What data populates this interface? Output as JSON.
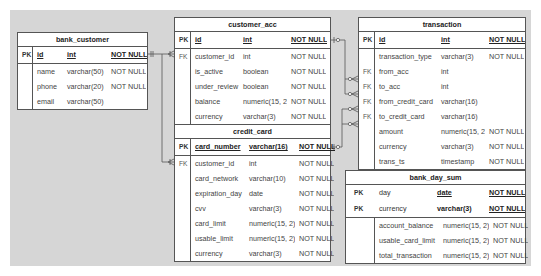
{
  "diagram": {
    "background": "#d6d6d6",
    "tables": {
      "bank_customer": {
        "title": "bank_customer",
        "pk": [
          {
            "key": "PK",
            "name": "id",
            "type": "int",
            "null": "NOT NULL"
          }
        ],
        "columns": [
          {
            "key": "",
            "name": "name",
            "type": "varchar(50)",
            "null": "NOT NULL"
          },
          {
            "key": "",
            "name": "phone",
            "type": "varchar(20)",
            "null": "NOT NULL"
          },
          {
            "key": "",
            "name": "email",
            "type": "varchar(50)",
            "null": ""
          }
        ]
      },
      "customer_acc": {
        "title": "customer_acc",
        "pk": [
          {
            "key": "PK",
            "name": "id",
            "type": "int",
            "null": "NOT NULL"
          }
        ],
        "columns": [
          {
            "key": "FK",
            "name": "customer_id",
            "type": "int",
            "null": "NOT NULL"
          },
          {
            "key": "",
            "name": "is_active",
            "type": "boolean",
            "null": "NOT NULL"
          },
          {
            "key": "",
            "name": "under_review",
            "type": "boolean",
            "null": "NOT NULL"
          },
          {
            "key": "",
            "name": "balance",
            "type": "numeric(15, 2)",
            "null": "NOT NULL"
          },
          {
            "key": "",
            "name": "currency",
            "type": "varchar(3)",
            "null": "NOT NULL"
          }
        ]
      },
      "credit_card": {
        "title": "credit_card",
        "pk": [
          {
            "key": "PK",
            "name": "card_number",
            "type": "varchar(16)",
            "null": "NOT NULL"
          }
        ],
        "columns": [
          {
            "key": "FK",
            "name": "customer_id",
            "type": "int",
            "null": "NOT NULL"
          },
          {
            "key": "",
            "name": "card_network",
            "type": "varchar(10)",
            "null": "NOT NULL"
          },
          {
            "key": "",
            "name": "expiration_day",
            "type": "date",
            "null": "NOT NULL"
          },
          {
            "key": "",
            "name": "cvv",
            "type": "varchar(3)",
            "null": "NOT NULL"
          },
          {
            "key": "",
            "name": "card_limit",
            "type": "numeric(15, 2)",
            "null": "NOT NULL"
          },
          {
            "key": "",
            "name": "usable_limit",
            "type": "numeric(15, 2)",
            "null": "NOT NULL"
          },
          {
            "key": "",
            "name": "currency",
            "type": "varchar(3)",
            "null": "NOT NULL"
          }
        ]
      },
      "transaction": {
        "title": "transaction",
        "pk": [
          {
            "key": "PK",
            "name": "id",
            "type": "int",
            "null": "NOT NULL"
          }
        ],
        "columns": [
          {
            "key": "",
            "name": "transaction_type",
            "type": "varchar(3)",
            "null": "NOT NULL"
          },
          {
            "key": "FK",
            "name": "from_acc",
            "type": "int",
            "null": ""
          },
          {
            "key": "FK",
            "name": "to_acc",
            "type": "int",
            "null": ""
          },
          {
            "key": "FK",
            "name": "from_credit_card",
            "type": "varchar(16)",
            "null": ""
          },
          {
            "key": "FK",
            "name": "to_credit_card",
            "type": "varchar(16)",
            "null": ""
          },
          {
            "key": "",
            "name": "amount",
            "type": "numeric(15, 2)",
            "null": "NOT NULL"
          },
          {
            "key": "",
            "name": "currency",
            "type": "varchar(3)",
            "null": "NOT NULL"
          },
          {
            "key": "",
            "name": "trans_ts",
            "type": "timestamp",
            "null": "NOT NULL"
          }
        ]
      },
      "bank_day_sum": {
        "title": "bank_day_sum",
        "pk": [
          {
            "key": "PK",
            "name": "day",
            "type": "date",
            "null": "NOT NULL"
          },
          {
            "key": "PK",
            "name": "currency",
            "type": "varchar(3)",
            "null": "NOT NULL"
          }
        ],
        "columns": [
          {
            "key": "",
            "name": "account_balance",
            "type": "numeric(15, 2)",
            "null": "NOT NULL"
          },
          {
            "key": "",
            "name": "usable_card_limit",
            "type": "numeric(15, 2)",
            "null": "NOT NULL"
          },
          {
            "key": "",
            "name": "total_transaction",
            "type": "numeric(15, 2)",
            "null": "NOT NULL"
          }
        ]
      }
    },
    "relationships": [
      {
        "from": "bank_customer.id",
        "to": "customer_acc.customer_id",
        "type": "one-to-many"
      },
      {
        "from": "bank_customer.id",
        "to": "credit_card.customer_id",
        "type": "one-to-many"
      },
      {
        "from": "customer_acc.id",
        "to": "transaction.from_acc",
        "type": "zero-or-one-to-zero-or-many"
      },
      {
        "from": "customer_acc.id",
        "to": "transaction.to_acc",
        "type": "zero-or-one-to-zero-or-many"
      },
      {
        "from": "credit_card.card_number",
        "to": "transaction.from_credit_card",
        "type": "zero-or-one-to-zero-or-many"
      },
      {
        "from": "credit_card.card_number",
        "to": "transaction.to_credit_card",
        "type": "zero-or-one-to-zero-or-many"
      }
    ]
  }
}
